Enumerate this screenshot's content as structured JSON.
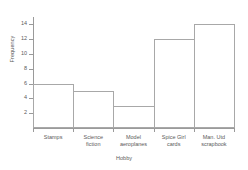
{
  "chart_data": {
    "type": "bar",
    "title": "",
    "xlabel": "Hobby",
    "ylabel": "Frequency",
    "categories": [
      "Stamps",
      "Science fiction",
      "Model aeroplanes",
      "Spice Girl cards",
      "Man. Utd scrapbook"
    ],
    "values": [
      6,
      5,
      3,
      12,
      14
    ],
    "ylim": [
      0,
      15
    ],
    "yticks": [
      2,
      4,
      6,
      8,
      10,
      12,
      14
    ],
    "ytick_labels": [
      "2",
      "4",
      "6",
      "8",
      "10",
      "12",
      "14"
    ],
    "grid": false,
    "legend": null,
    "bar_fill": "#ffffff",
    "bar_outline": "#a8a8a8",
    "axis_color": "#9a9a9a",
    "text_color": "#5a5a5a",
    "background": "#ffffff",
    "category_label_lines": [
      [
        "Stamps"
      ],
      [
        "Science",
        "fiction"
      ],
      [
        "Model",
        "aeroplanes"
      ],
      [
        "Spice Girl",
        "cards"
      ],
      [
        "Man. Utd",
        "scrapbook"
      ]
    ]
  }
}
